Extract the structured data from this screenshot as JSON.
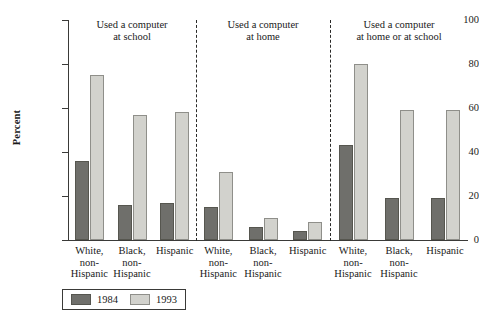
{
  "chart_data": {
    "type": "bar",
    "title": "",
    "xlabel": "",
    "ylabel": "Percent",
    "ylim": [
      0,
      100
    ],
    "yticks": [
      0,
      20,
      40,
      60,
      80,
      100
    ],
    "grid": false,
    "legend_position": "bottom-left",
    "categories": [
      "White, non-Hispanic",
      "Black, non-Hispanic",
      "Hispanic"
    ],
    "panels": [
      {
        "title": "Used a computer at school",
        "title_line1": "Used a computer",
        "title_line2": "at school",
        "series": [
          {
            "name": "1984",
            "values": [
              36,
              16,
              17
            ]
          },
          {
            "name": "1993",
            "values": [
              75,
              57,
              58
            ]
          }
        ]
      },
      {
        "title": "Used a computer at home",
        "title_line1": "Used a computer",
        "title_line2": "at home",
        "series": [
          {
            "name": "1984",
            "values": [
              15,
              6,
              4
            ]
          },
          {
            "name": "1993",
            "values": [
              31,
              10,
              8
            ]
          }
        ]
      },
      {
        "title": "Used a computer at home or at school",
        "title_line1": "Used a computer",
        "title_line2": "at home or at school",
        "series": [
          {
            "name": "1984",
            "values": [
              43,
              19,
              19
            ]
          },
          {
            "name": "1993",
            "values": [
              80,
              59,
              59
            ]
          }
        ]
      }
    ],
    "series_colors": {
      "1984": "#6f6f6b",
      "1993": "#d2d2cd"
    }
  },
  "axis": {
    "y_label": "Percent",
    "y_tick_labels": [
      "0",
      "20",
      "40",
      "60",
      "80",
      "100"
    ]
  },
  "panels": [
    {
      "title_line1": "Used a computer",
      "title_line2": "at school",
      "cats": [
        {
          "l1": "White,",
          "l2": "non-",
          "l3": "Hispanic"
        },
        {
          "l1": "Black,",
          "l2": "non-",
          "l3": "Hispanic"
        },
        {
          "l1": "Hispanic",
          "l2": "",
          "l3": ""
        }
      ]
    },
    {
      "title_line1": "Used a computer",
      "title_line2": "at home",
      "cats": [
        {
          "l1": "White,",
          "l2": "non-",
          "l3": "Hispanic"
        },
        {
          "l1": "Black,",
          "l2": "non-",
          "l3": "Hispanic"
        },
        {
          "l1": "Hispanic",
          "l2": "",
          "l3": ""
        }
      ]
    },
    {
      "title_line1": "Used a computer",
      "title_line2": "at home or at school",
      "cats": [
        {
          "l1": "White,",
          "l2": "non-",
          "l3": "Hispanic"
        },
        {
          "l1": "Black,",
          "l2": "non-",
          "l3": "Hispanic"
        },
        {
          "l1": "Hispanic",
          "l2": "",
          "l3": ""
        }
      ]
    }
  ],
  "legend": {
    "items": [
      {
        "label": "1984",
        "color": "#6f6f6b"
      },
      {
        "label": "1993",
        "color": "#d2d2cd"
      }
    ]
  }
}
